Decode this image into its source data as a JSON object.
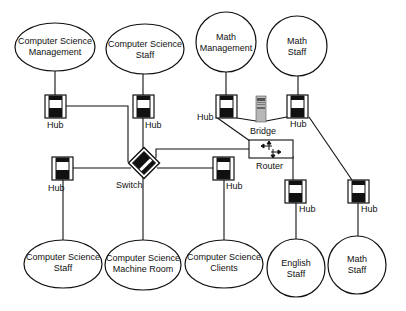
{
  "diagram": {
    "title": "",
    "nodes": {
      "cs_management": {
        "line1": "Computer Science",
        "line2": "Management"
      },
      "cs_staff_top": {
        "line1": "Computer Science",
        "line2": "Staff"
      },
      "math_management": {
        "line1": "Math",
        "line2": "Management"
      },
      "math_staff_top": {
        "line1": "Math",
        "line2": "Staff"
      },
      "cs_staff_bottom": {
        "line1": "Computer Science",
        "line2": "Staff"
      },
      "cs_machine_room": {
        "line1": "Computer Science",
        "line2": "Machine Room"
      },
      "cs_clients": {
        "line1": "Computer Science",
        "line2": "Clients"
      },
      "english_staff": {
        "line1": "English",
        "line2": "Staff"
      },
      "math_staff_bottom": {
        "line1": "Math",
        "line2": "Staff"
      }
    },
    "devices": {
      "hub_cs_management": {
        "label": "Hub"
      },
      "hub_cs_staff_top": {
        "label": "Hub"
      },
      "hub_math_management": {
        "label": "Hub"
      },
      "bridge": {
        "label": "Bridge"
      },
      "hub_math_staff_top": {
        "label": "Hub"
      },
      "switch": {
        "label": "Switch"
      },
      "router": {
        "label": "Router"
      },
      "hub_cs_staff_bottom": {
        "label": "Hub"
      },
      "hub_cs_clients": {
        "label": "Hub"
      },
      "hub_english_staff": {
        "label": "Hub"
      },
      "hub_math_staff_bottom": {
        "label": "Hub"
      }
    },
    "colors": {
      "stroke": "#111111",
      "background": "#ffffff",
      "bridge_fill": "#b8b8b8"
    }
  }
}
